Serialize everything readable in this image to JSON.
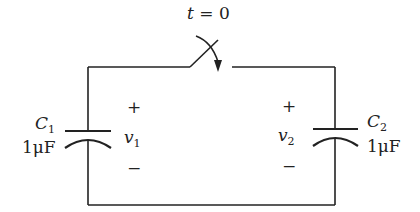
{
  "switch": {
    "label_var": "t",
    "label_eq": "= 0"
  },
  "capacitors": [
    {
      "name_var": "C",
      "name_sub": "1",
      "value": "1μF",
      "voltage_var": "v",
      "voltage_sub": "1",
      "plus": "+",
      "minus": "−"
    },
    {
      "name_var": "C",
      "name_sub": "2",
      "value": "1μF",
      "voltage_var": "v",
      "voltage_sub": "2",
      "plus": "+",
      "minus": "−"
    }
  ]
}
